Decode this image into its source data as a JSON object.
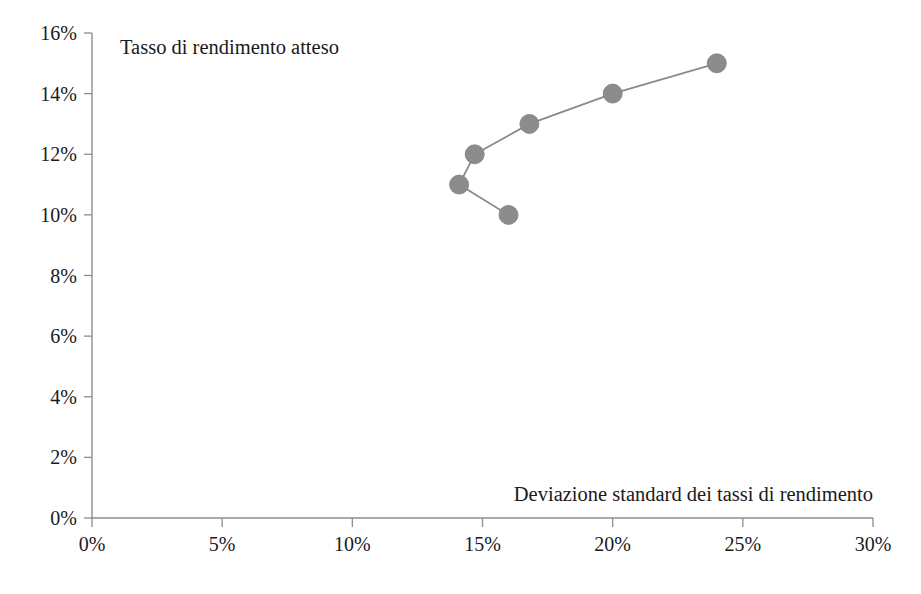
{
  "chart_data": {
    "type": "scatter",
    "title": "",
    "xlabel": "Deviazione standard dei tassi di rendimento",
    "ylabel": "Tasso di rendimento atteso",
    "xlim": [
      0,
      30
    ],
    "ylim": [
      0,
      16
    ],
    "grid": false,
    "legend": "none",
    "x_tick_labels": [
      "0%",
      "5%",
      "10%",
      "15%",
      "20%",
      "25%",
      "30%"
    ],
    "x_tick_values": [
      0,
      5,
      10,
      15,
      20,
      25,
      30
    ],
    "y_tick_labels": [
      "0%",
      "2%",
      "4%",
      "6%",
      "8%",
      "10%",
      "12%",
      "14%",
      "16%"
    ],
    "y_tick_values": [
      0,
      2,
      4,
      6,
      8,
      10,
      12,
      14,
      16
    ],
    "marker_color": "#8c8c8c",
    "line_color": "#8a8a8a",
    "axis_color": "#8d8d8d",
    "background_color": "#ffffff",
    "series": [
      {
        "name": "Frontiera dei portafogli",
        "x": [
          16.0,
          14.1,
          14.7,
          16.8,
          20.0,
          24.0
        ],
        "y": [
          10,
          11,
          12,
          13,
          14,
          15
        ],
        "point_labels": [
          "16%, 10%",
          "14.1%, 11%",
          "14.7%, 12%",
          "16.8%, 13%",
          "20%, 14%",
          "24%, 15%"
        ]
      }
    ]
  },
  "axis_titles": {
    "y": "Tasso di rendimento atteso",
    "x": "Deviazione standard dei tassi di rendimento"
  }
}
